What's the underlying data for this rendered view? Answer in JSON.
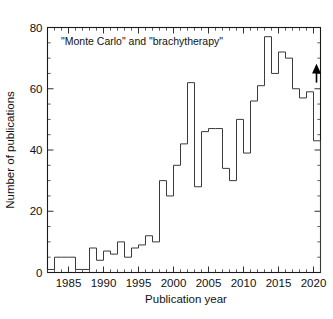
{
  "chart_data": {
    "type": "bar",
    "title": "",
    "annotation": "\"Monte Carlo\" and \"brachytherapy\"",
    "xlabel": "Publication year",
    "ylabel": "Number of publications",
    "xlim": [
      1982,
      2021
    ],
    "ylim": [
      0,
      80
    ],
    "xticks": [
      1985,
      1990,
      1995,
      2000,
      2005,
      2010,
      2015,
      2020
    ],
    "xtick_labels": [
      "1985",
      "1990",
      "1995",
      "2000",
      "2005",
      "2010",
      "2015",
      "2020"
    ],
    "yticks": [
      0,
      20,
      40,
      60,
      80
    ],
    "ytick_labels": [
      "0",
      "20",
      "40",
      "60",
      "80"
    ],
    "grid": false,
    "legend": "none",
    "style": "histogram-step-outline",
    "categories": [
      1982,
      1983,
      1984,
      1985,
      1986,
      1987,
      1988,
      1989,
      1990,
      1991,
      1992,
      1993,
      1994,
      1995,
      1996,
      1997,
      1998,
      1999,
      2000,
      2001,
      2002,
      2003,
      2004,
      2005,
      2006,
      2007,
      2008,
      2009,
      2010,
      2011,
      2012,
      2013,
      2014,
      2015,
      2016,
      2017,
      2018,
      2019,
      2020,
      2021
    ],
    "values": [
      1,
      5,
      5,
      5,
      1,
      1,
      8,
      4,
      7,
      6,
      10,
      5,
      8,
      9,
      12,
      10,
      30,
      25,
      35,
      42,
      62,
      28,
      46,
      47,
      47,
      34,
      30,
      50,
      39,
      56,
      61,
      77,
      65,
      72,
      70,
      60,
      57,
      59,
      43,
      26
    ],
    "xunits": "year",
    "yunits": "publications",
    "marker_annotation": {
      "label": "up-arrow-partial-year",
      "year": 2021,
      "value": 62,
      "direction": "up"
    }
  },
  "axes": {
    "frame": "box",
    "tick_direction": "in",
    "minor_ticks": true,
    "minor_per_major_x": 5,
    "minor_per_major_y": 4
  },
  "colors": {
    "line": "#3a3a3a",
    "axis": "#1a1a1a",
    "text": "#111111",
    "background": "#ffffff"
  }
}
